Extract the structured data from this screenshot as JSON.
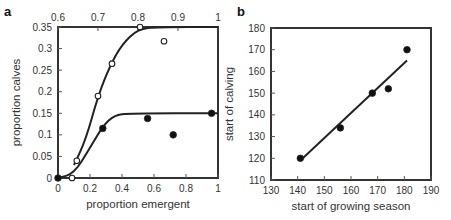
{
  "chart_data": [
    {
      "panel": "a",
      "type": "scatter",
      "xlabel": "proportion emergent",
      "ylabel": "proportion calves",
      "xlim": [
        0,
        1
      ],
      "x2lim": [
        0.6,
        1
      ],
      "ylim": [
        0,
        0.35
      ],
      "xticks": [
        "0",
        "0.2",
        "0.4",
        "0.6",
        "0.8",
        "1"
      ],
      "x2ticks": [
        "0.6",
        "0.7",
        "0.8",
        "0.9",
        "1"
      ],
      "yticks": [
        "0",
        "0.05",
        "0.1",
        "0.15",
        "0.2",
        "0.25",
        "0.3",
        "0.35"
      ],
      "grid": false,
      "series": [
        {
          "name": "filled (bottom axis)",
          "marker": "filled-circle",
          "axis": "bottom",
          "points": [
            [
              0,
              0
            ],
            [
              0.28,
              0.115
            ],
            [
              0.56,
              0.138
            ],
            [
              0.72,
              0.1
            ],
            [
              0.96,
              0.15
            ]
          ],
          "fit_curve": [
            [
              0,
              0
            ],
            [
              0.1,
              0.01
            ],
            [
              0.2,
              0.07
            ],
            [
              0.28,
              0.12
            ],
            [
              0.35,
              0.145
            ],
            [
              0.45,
              0.15
            ],
            [
              1,
              0.15
            ]
          ]
        },
        {
          "name": "open (top axis)",
          "marker": "open-circle",
          "axis": "top",
          "points": [
            [
              0.635,
              0
            ],
            [
              0.647,
              0.04
            ],
            [
              0.7,
              0.19
            ],
            [
              0.735,
              0.265
            ],
            [
              0.865,
              0.317
            ],
            [
              0.805,
              0.35
            ]
          ],
          "fit_curve": [
            [
              0.64,
              0.03
            ],
            [
              0.67,
              0.09
            ],
            [
              0.7,
              0.19
            ],
            [
              0.73,
              0.26
            ],
            [
              0.76,
              0.31
            ],
            [
              0.8,
              0.345
            ],
            [
              0.85,
              0.35
            ],
            [
              1,
              0.35
            ]
          ]
        }
      ]
    },
    {
      "panel": "b",
      "type": "scatter",
      "xlabel": "start of growing season",
      "ylabel": "start of calving",
      "xlim": [
        130,
        190
      ],
      "ylim": [
        110,
        180
      ],
      "xticks": [
        "130",
        "140",
        "150",
        "160",
        "170",
        "180",
        "190"
      ],
      "yticks": [
        "110",
        "120",
        "130",
        "140",
        "150",
        "160",
        "170",
        "180"
      ],
      "grid": false,
      "series": [
        {
          "name": "observations",
          "marker": "filled-circle",
          "points": [
            [
              141,
              120
            ],
            [
              156,
              134
            ],
            [
              168,
              150
            ],
            [
              174,
              152
            ],
            [
              181,
              170
            ]
          ],
          "fit_line": [
            [
              141,
              119
            ],
            [
              181,
              165
            ]
          ]
        }
      ]
    }
  ],
  "labels": {
    "panel_a": "a",
    "panel_b": "b"
  }
}
